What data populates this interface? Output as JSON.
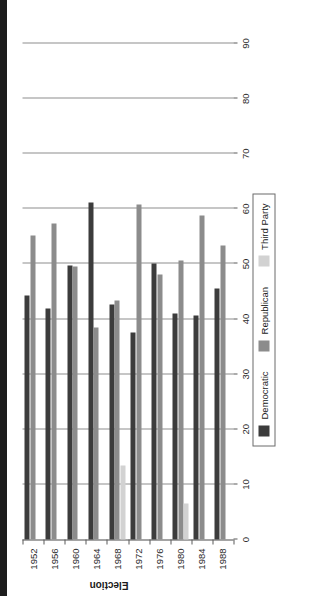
{
  "chart_data": {
    "type": "bar",
    "title": "",
    "xlabel": "Election",
    "ylabel": "Percentage Vote",
    "orientation": "horizontal-grouped-rotated",
    "grid": true,
    "legend_position": "right-inside",
    "ylim": [
      0,
      90
    ],
    "yticks": [
      0,
      10,
      20,
      30,
      40,
      50,
      60,
      70,
      80,
      90
    ],
    "categories": [
      "1952",
      "1956",
      "1960",
      "1964",
      "1968",
      "1972",
      "1976",
      "1980",
      "1984",
      "1988"
    ],
    "series": [
      {
        "name": "Democratic",
        "color": "#3c3c3c",
        "values": [
          44.3,
          42.0,
          49.7,
          61.1,
          42.7,
          37.5,
          50.1,
          41.0,
          40.6,
          45.6
        ]
      },
      {
        "name": "Republican",
        "color": "#8c8c8c",
        "values": [
          55.1,
          57.4,
          49.5,
          38.5,
          43.4,
          60.7,
          48.0,
          50.7,
          58.8,
          53.4
        ]
      },
      {
        "name": "Third Party",
        "color": "#d2d2d2",
        "values": [
          0,
          0,
          0,
          0,
          13.5,
          0,
          0,
          6.6,
          0,
          0
        ]
      }
    ]
  },
  "axes": {
    "x_title": "Election",
    "y_title": "Percentage Vote",
    "y_tick_labels": [
      "0",
      "10",
      "20",
      "30",
      "40",
      "50",
      "60",
      "70",
      "80",
      "90"
    ],
    "x_tick_labels": [
      "1952",
      "1956",
      "1960",
      "1964",
      "1968",
      "1972",
      "1976",
      "1980",
      "1984",
      "1988"
    ]
  },
  "legend": {
    "items": [
      {
        "label": "Democratic",
        "color": "#3c3c3c"
      },
      {
        "label": "Republican",
        "color": "#8c8c8c"
      },
      {
        "label": "Third Party",
        "color": "#d2d2d2"
      }
    ]
  }
}
